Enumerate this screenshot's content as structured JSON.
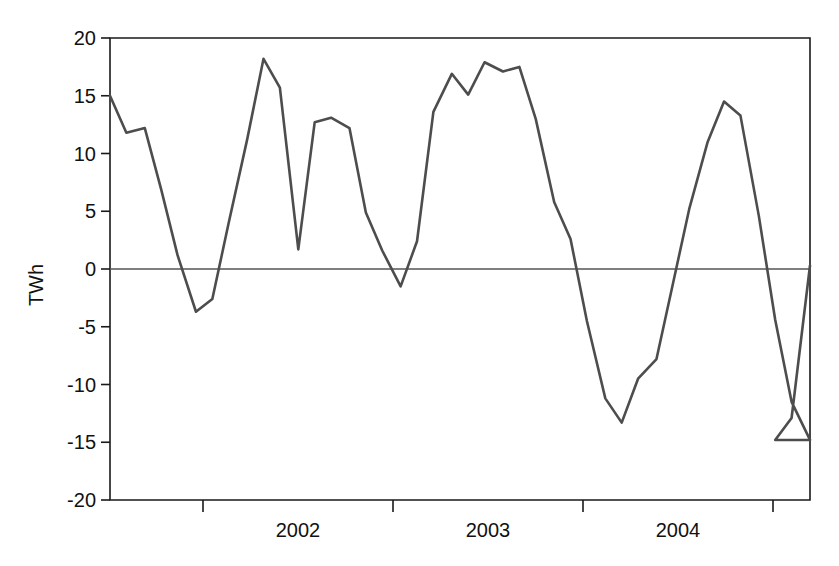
{
  "chart_data": {
    "type": "line",
    "title": "",
    "subtitle": "",
    "xlabel": "",
    "ylabel": "TWh",
    "ylim": [
      -20,
      20
    ],
    "yticks": [
      -20,
      -15,
      -10,
      -5,
      0,
      5,
      10,
      15,
      20
    ],
    "ytick_labels": [
      "-20",
      "-15",
      "-10",
      "-5",
      "0",
      "5",
      "10",
      "15",
      "20"
    ],
    "xlim": [
      2001.2,
      2004.62
    ],
    "xtick_positions": [
      2001.75,
      2002.75,
      2003.75,
      2004.75
    ],
    "xtick_labels": [
      "",
      "",
      "",
      ""
    ],
    "x_category_labels": [
      "2002",
      "2003",
      "2004"
    ],
    "x_category_centers": [
      2002.25,
      2003.25,
      2004.25
    ],
    "grid": false,
    "legend": false,
    "legend_position": "none",
    "zero_line": true,
    "line_color": "#4d4d4d",
    "axis_color": "#1a1a1a",
    "background": "#ffffff",
    "annotations": [],
    "series": [
      {
        "name": "TWh",
        "x": [
          2001.2,
          2001.28,
          2001.37,
          2001.45,
          2001.53,
          2001.62,
          2001.7,
          2001.78,
          2001.87,
          2001.95,
          2002.03,
          2002.12,
          2002.2,
          2002.28,
          2002.37,
          2002.45,
          2002.53,
          2002.62,
          2002.7,
          2002.78,
          2002.87,
          2002.95,
          2003.03,
          2003.12,
          2003.2,
          2003.28,
          2003.37,
          2003.45,
          2003.53,
          2003.62,
          2003.7,
          2003.78,
          2003.87,
          2003.95,
          2004.03,
          2004.12,
          2004.2,
          2004.28,
          2004.37,
          2004.45,
          2004.53,
          2004.62
        ],
        "values": [
          15.0,
          11.8,
          12.2,
          6.9,
          1.2,
          -3.7,
          -2.6,
          4.0,
          11.2,
          18.2,
          15.7,
          1.7,
          12.7,
          13.1,
          12.2,
          4.9,
          1.6,
          -1.5,
          2.4,
          13.6,
          16.9,
          15.1,
          17.9,
          17.1,
          17.5,
          13.0,
          5.8,
          2.6,
          -4.5,
          -11.2,
          -13.3,
          -9.5,
          -7.8,
          -1.3,
          5.2,
          11.0,
          14.5,
          13.3,
          4.6,
          -4.4,
          -11.5,
          -14.8
        ]
      }
    ],
    "series_tail": {
      "x": [
        2004.45,
        2004.53,
        2004.62
      ],
      "values": [
        -14.8,
        -12.9,
        0.3
      ]
    }
  },
  "axes": {
    "y_axis_label": "TWh",
    "y_tick_values": [
      "20",
      "15",
      "10",
      "5",
      "0",
      "-5",
      "-10",
      "-15",
      "-20"
    ],
    "x_tick_values": [
      "2002",
      "2003",
      "2004"
    ]
  }
}
